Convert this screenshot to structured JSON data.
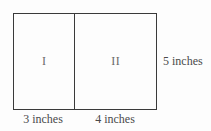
{
  "figure": {
    "type": "partitioned-rectangle-diagram",
    "background_color": "#fdfdfd",
    "line_color": "#3a3a3a",
    "dimension_text_color": "#4a4a4a",
    "region_text_color": "#6a6a6a",
    "regions": [
      {
        "label": "I",
        "width_label": "3 inches"
      },
      {
        "label": "II",
        "width_label": "4 inches"
      }
    ],
    "height_label": "5 inches"
  }
}
